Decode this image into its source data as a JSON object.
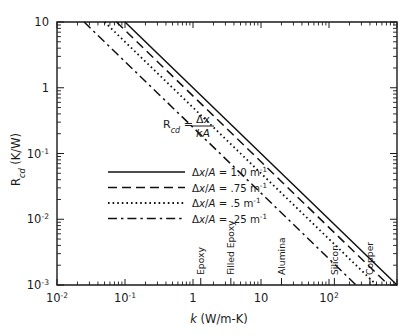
{
  "chart_data": {
    "type": "line",
    "title": "",
    "xlabel": "k (W/m-K)",
    "ylabel": "R_cd (K/W)",
    "xscale": "log",
    "yscale": "log",
    "xlim": [
      0.01,
      1000
    ],
    "ylim": [
      0.001,
      10
    ],
    "grid": false,
    "legend_position": "center-left",
    "annotation": {
      "text": "R_cd = Δx / kA",
      "lhs": "R",
      "lhs_sub": "cd",
      "equals": "=",
      "numerator": "Δx",
      "denominator": "kA"
    },
    "x_tick_labels": [
      "10⁻²",
      "10⁻¹",
      "1",
      "10",
      "10²"
    ],
    "x_tick_values": [
      0.01,
      0.1,
      1,
      10,
      100
    ],
    "y_tick_labels": [
      "10⁻³",
      "10⁻²",
      "10⁻¹",
      "1",
      "10"
    ],
    "y_tick_values": [
      0.001,
      0.01,
      0.1,
      1,
      10
    ],
    "series": [
      {
        "name": "Δx/A = 1.0 m⁻¹",
        "coefficient": 1.0,
        "style": "solid",
        "formula": "R = (Δx/A)/k",
        "points": [
          [
            0.1,
            10
          ],
          [
            1000,
            0.001
          ]
        ]
      },
      {
        "name": "Δx/A = .75 m⁻¹",
        "coefficient": 0.75,
        "style": "dashed",
        "formula": "R = (Δx/A)/k",
        "points": [
          [
            0.075,
            10
          ],
          [
            1000,
            0.00075
          ]
        ]
      },
      {
        "name": "Δx/A = .5 m⁻¹",
        "coefficient": 0.5,
        "style": "dotted",
        "formula": "R = (Δx/A)/k",
        "points": [
          [
            0.05,
            10
          ],
          [
            1000,
            0.0005
          ]
        ]
      },
      {
        "name": "Δx/A = .25 m⁻¹",
        "coefficient": 0.25,
        "style": "dashdot",
        "formula": "R = (Δx/A)/k",
        "points": [
          [
            0.025,
            10
          ],
          [
            1000,
            0.00025
          ]
        ]
      }
    ],
    "material_markers": [
      {
        "label": "Epoxy",
        "k": 1.3
      },
      {
        "label": "Filled Epoxy",
        "k": 3.6
      },
      {
        "label": "Alumina",
        "k": 20
      },
      {
        "label": "Silicon",
        "k": 120
      },
      {
        "label": "Copper",
        "k": 400
      }
    ]
  },
  "legend": {
    "entries": [
      {
        "prefix": "Δx/A",
        "equals": "=",
        "value": "1.0",
        "unit": "m",
        "exp": "-1"
      },
      {
        "prefix": "Δx/A",
        "equals": "=",
        "value": ".75",
        "unit": "m",
        "exp": "-1"
      },
      {
        "prefix": "Δx/A",
        "equals": "=",
        "value": ".5",
        "unit": "m",
        "exp": "-1"
      },
      {
        "prefix": "Δx/A",
        "equals": "=",
        "value": ".25",
        "unit": "m",
        "exp": "-1"
      }
    ]
  },
  "axes": {
    "y_label_main": "R",
    "y_label_sub": "cd",
    "y_label_unit": "(K/W)",
    "x_label_main": "k",
    "x_label_unit": "(W/m-K)",
    "x_ticks": [
      {
        "label_base": "10",
        "label_exp": "-2"
      },
      {
        "label_base": "10",
        "label_exp": "-1"
      },
      {
        "label_base": "1",
        "label_exp": ""
      },
      {
        "label_base": "10",
        "label_exp": ""
      },
      {
        "label_base": "10",
        "label_exp": "2"
      }
    ],
    "y_ticks": [
      {
        "label_base": "10",
        "label_exp": "-3"
      },
      {
        "label_base": "10",
        "label_exp": "-2"
      },
      {
        "label_base": "10",
        "label_exp": "-1"
      },
      {
        "label_base": "1",
        "label_exp": ""
      },
      {
        "label_base": "10",
        "label_exp": ""
      }
    ]
  }
}
